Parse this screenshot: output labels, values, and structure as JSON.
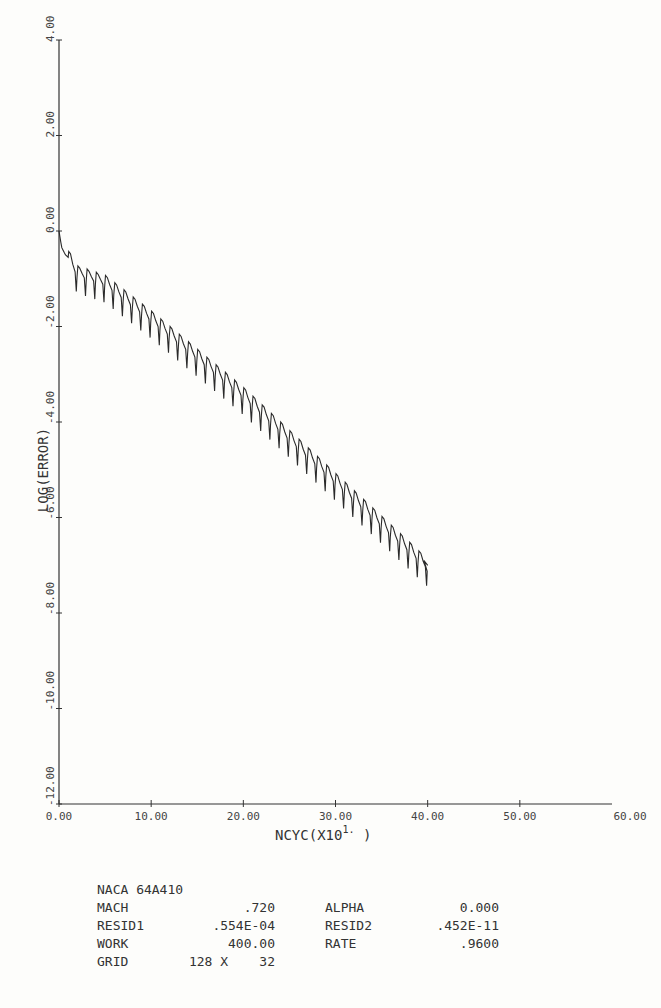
{
  "chart_data": {
    "type": "line",
    "title": "",
    "xlabel": "NCYC(X10^1.)",
    "xlabel_parts": {
      "main": "NCYC(X10",
      "sup": "1.",
      "close": " )"
    },
    "ylabel": "LOG(ERROR)",
    "xlim": [
      0,
      60
    ],
    "ylim": [
      -12,
      4
    ],
    "grid": false,
    "legend": null,
    "x_ticks": [
      0,
      10,
      20,
      30,
      40,
      50,
      60
    ],
    "x_tick_labels": [
      "0.00",
      "10.00",
      "20.00",
      "30.00",
      "40.00",
      "50.00",
      "60.00"
    ],
    "y_ticks": [
      4,
      2,
      0,
      -2,
      -4,
      -6,
      -8,
      -10,
      -12
    ],
    "y_tick_labels": [
      "4.00",
      "2.00",
      "0.00",
      "-2.00",
      "-4.00",
      "-6.00",
      "-8.00",
      "-10.00",
      "-12.00"
    ],
    "series": [
      {
        "name": "LOG(ERROR)",
        "description": "Convergence history: drops from 0.0 to about -0.5 in first cycles, then periodic sawtooth (period 1.0 x-unit, i.e. 10 cycles) decaying roughly linearly to about -7.0 at x=40",
        "x": [
          0,
          0.3,
          0.7,
          1.0,
          2.0,
          5.0,
          10.0,
          15.0,
          20.0,
          25.0,
          30.0,
          35.0,
          40.0
        ],
        "values": [
          0.0,
          -0.35,
          -0.5,
          -0.55,
          -0.85,
          -1.05,
          -1.8,
          -2.6,
          -3.4,
          -4.3,
          -5.2,
          -6.1,
          -7.0
        ],
        "sawtooth": {
          "period": 1.0,
          "start_x": 1.0,
          "end_x": 40.0,
          "dip_depth": 0.45,
          "peak_rise": 0.12
        }
      }
    ]
  },
  "info_block": {
    "title": "NACA 64A410",
    "rows": [
      {
        "label1": "MACH",
        "value1": ".720",
        "label2": "ALPHA",
        "value2": "0.000"
      },
      {
        "label1": "RESID1",
        "value1": ".554E-04",
        "label2": "RESID2",
        "value2": ".452E-11"
      },
      {
        "label1": "WORK",
        "value1": "400.00",
        "label2": "RATE",
        "value2": ".9600"
      }
    ],
    "grid": {
      "label": "GRID",
      "value": "128 X    32"
    }
  },
  "colors": {
    "line": "#2a2a2a",
    "axis": "#333333",
    "paper": "#fdfdfb"
  }
}
